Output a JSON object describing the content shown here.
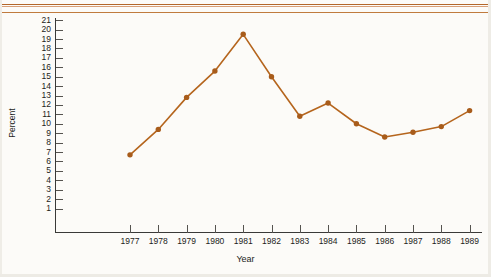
{
  "chart_data": {
    "type": "line",
    "title": "",
    "xlabel": "Year",
    "ylabel": "Percent",
    "categories": [
      "1977",
      "1978",
      "1979",
      "1980",
      "1981",
      "1982",
      "1983",
      "1984",
      "1985",
      "1986",
      "1987",
      "1988",
      "1989"
    ],
    "values": [
      6.7,
      9.4,
      12.8,
      15.6,
      19.5,
      15.0,
      10.8,
      12.2,
      10.0,
      8.6,
      9.1,
      9.7,
      11.4
    ],
    "series": [
      {
        "name": "Percent",
        "values": [
          6.7,
          9.4,
          12.8,
          15.6,
          19.5,
          15.0,
          10.8,
          12.2,
          10.0,
          8.6,
          9.1,
          9.7,
          11.4
        ]
      }
    ],
    "ylim": [
      0,
      21
    ],
    "xlim": [
      "1977",
      "1989"
    ],
    "ytick_labels": [
      "21",
      "20",
      "19",
      "18",
      "17",
      "16",
      "15",
      "14",
      "13",
      "12",
      "11",
      "10",
      "9",
      "8",
      "7",
      "6",
      "5",
      "4",
      "3",
      "2",
      "1"
    ],
    "ytick_values": [
      21,
      20,
      19,
      18,
      17,
      16,
      15,
      14,
      13,
      12,
      11,
      10,
      9,
      8,
      7,
      6,
      5,
      4,
      3,
      2,
      1
    ],
    "xtick_labels": [
      "1977",
      "1978",
      "1979",
      "1980",
      "1981",
      "1982",
      "1983",
      "1984",
      "1985",
      "1986",
      "1987",
      "1988",
      "1989"
    ],
    "grid": false,
    "legend": "none",
    "marker": "circle",
    "line_color": "#b5651d",
    "marker_color": "#a85c1b",
    "axis_color": "#3a3a38",
    "background_color": "#fcfbf8"
  },
  "decor": {
    "rule_color_top": "#b4672a",
    "rule_color_mid": "#d9a079",
    "rule_color_bottom": "#c07b3e"
  }
}
